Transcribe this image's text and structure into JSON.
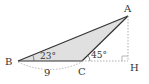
{
  "diagram": {
    "type": "triangle",
    "points": {
      "A": {
        "label": "A"
      },
      "B": {
        "label": "B"
      },
      "C": {
        "label": "C"
      },
      "H": {
        "label": "H"
      }
    },
    "angles": {
      "B": "23°",
      "C_exterior": "45°"
    },
    "lengths": {
      "BC": "9"
    },
    "fill_color": "#e0e0e0",
    "line_color": "#333333",
    "dashed_color": "#999999"
  }
}
